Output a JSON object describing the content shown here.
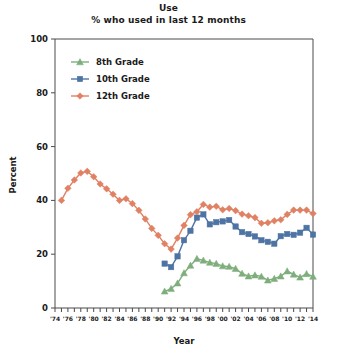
{
  "chart_data": {
    "type": "line",
    "title": "Use",
    "subtitle": "% who used in last 12 months",
    "xlabel": "Year",
    "ylabel": "Percent",
    "ylim": [
      0,
      100
    ],
    "yticks": [
      0,
      20,
      40,
      60,
      80,
      100
    ],
    "ytick_labels": [
      "0",
      "20",
      "40",
      "60",
      "80",
      "100"
    ],
    "xlim": [
      1974,
      2014
    ],
    "xticks": [
      1974,
      1976,
      1978,
      1980,
      1982,
      1984,
      1986,
      1988,
      1990,
      1992,
      1994,
      1996,
      1998,
      2000,
      2002,
      2004,
      2006,
      2008,
      2010,
      2012,
      2014
    ],
    "xtick_labels": [
      "'74",
      "'76",
      "'78",
      "'80",
      "'82",
      "'84",
      "'86",
      "'88",
      "'90",
      "'92",
      "'94",
      "'96",
      "'98",
      "'00",
      "'02",
      "'04",
      "'06",
      "'08",
      "'10",
      "'12",
      "'14"
    ],
    "grid": false,
    "legend_position": "upper-left-inside",
    "series": [
      {
        "name": "8th Grade",
        "color": "#7fae7c",
        "marker": "triangle",
        "x": [
          1991,
          1992,
          1993,
          1994,
          1995,
          1996,
          1997,
          1998,
          1999,
          2000,
          2001,
          2002,
          2003,
          2004,
          2005,
          2006,
          2007,
          2008,
          2009,
          2010,
          2011,
          2012,
          2013,
          2014
        ],
        "values": [
          6.2,
          7.2,
          9.2,
          13.0,
          15.8,
          18.3,
          17.7,
          16.9,
          16.5,
          15.6,
          15.4,
          14.6,
          12.8,
          11.8,
          12.2,
          11.7,
          10.3,
          10.9,
          11.8,
          13.7,
          12.5,
          11.4,
          12.7,
          11.7
        ]
      },
      {
        "name": "10th Grade",
        "color": "#4e74a4",
        "marker": "square",
        "x": [
          1991,
          1992,
          1993,
          1994,
          1995,
          1996,
          1997,
          1998,
          1999,
          2000,
          2001,
          2002,
          2003,
          2004,
          2005,
          2006,
          2007,
          2008,
          2009,
          2010,
          2011,
          2012,
          2013,
          2014
        ],
        "values": [
          16.5,
          15.2,
          19.2,
          25.2,
          28.7,
          33.6,
          34.8,
          31.1,
          31.9,
          32.2,
          32.7,
          30.3,
          28.2,
          27.5,
          26.6,
          25.2,
          24.6,
          23.9,
          26.7,
          27.5,
          27.2,
          28.0,
          29.8,
          27.3
        ]
      },
      {
        "name": "12th Grade",
        "color": "#e08163",
        "marker": "diamond",
        "x": [
          1975,
          1976,
          1977,
          1978,
          1979,
          1980,
          1981,
          1982,
          1983,
          1984,
          1985,
          1986,
          1987,
          1988,
          1989,
          1990,
          1991,
          1992,
          1993,
          1994,
          1995,
          1996,
          1997,
          1998,
          1999,
          2000,
          2001,
          2002,
          2003,
          2004,
          2005,
          2006,
          2007,
          2008,
          2009,
          2010,
          2011,
          2012,
          2013,
          2014
        ],
        "values": [
          40.0,
          44.5,
          47.6,
          50.2,
          50.8,
          48.8,
          46.1,
          44.3,
          42.3,
          40.0,
          40.6,
          38.8,
          36.3,
          33.1,
          29.6,
          27.0,
          23.9,
          21.9,
          26.0,
          30.7,
          34.7,
          35.8,
          38.5,
          37.5,
          37.8,
          36.5,
          37.0,
          36.2,
          34.9,
          34.3,
          33.6,
          31.5,
          31.7,
          32.4,
          32.8,
          34.8,
          36.4,
          36.4,
          36.4,
          35.1
        ]
      }
    ]
  },
  "legend": {
    "items": [
      {
        "label": "8th Grade"
      },
      {
        "label": "10th Grade"
      },
      {
        "label": "12th Grade"
      }
    ]
  }
}
